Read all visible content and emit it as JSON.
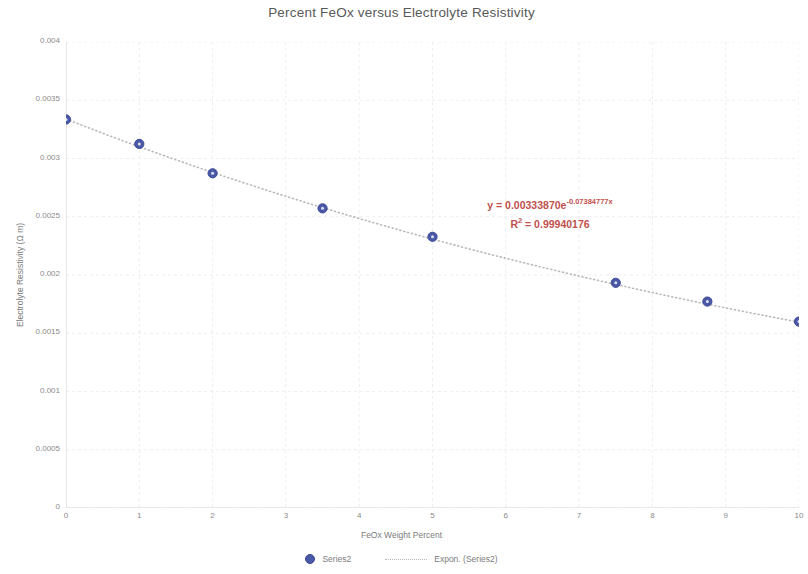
{
  "chart_data": {
    "type": "scatter",
    "title": "Percent FeOx versus Electrolyte Resistivity",
    "xlabel": "FeOx Weight Percent",
    "ylabel": "Electrolyte Resistivity (Ω m)",
    "xlim": [
      0,
      10
    ],
    "ylim": [
      0,
      0.004
    ],
    "xticks": [
      "0",
      "1",
      "2",
      "3",
      "4",
      "5",
      "6",
      "7",
      "8",
      "9",
      "10"
    ],
    "xtick_values": [
      0,
      1,
      2,
      3,
      4,
      5,
      6,
      7,
      8,
      9,
      10
    ],
    "yticks": [
      "0",
      "0.0005",
      "0.001",
      "0.0015",
      "0.002",
      "0.0025",
      "0.003",
      "0.0035",
      "0.004"
    ],
    "ytick_values": [
      0,
      0.0005,
      0.001,
      0.0015,
      0.002,
      0.0025,
      0.003,
      0.0035,
      0.004
    ],
    "grid": true,
    "legend_position": "bottom",
    "series": [
      {
        "name": "Series2",
        "type": "scatter",
        "marker_color": "#4a58a8",
        "x": [
          0,
          1,
          2,
          3.5,
          5,
          7.5,
          8.75,
          10
        ],
        "y": [
          0.003335,
          0.003125,
          0.002873,
          0.002572,
          0.002328,
          0.001933,
          0.001772,
          0.0016
        ]
      },
      {
        "name": "Expon. (Series2)",
        "type": "line",
        "style": "dotted",
        "line_color": "#b9b9b9",
        "fit": "exponential",
        "coefficient": 0.0033387,
        "exponent": -0.07384777,
        "r_squared": 0.99940176
      }
    ],
    "annotations": [
      {
        "name": "trendline-equation",
        "color": "#c0504d",
        "line1_prefix": "y = 0.00333870e",
        "line1_exponent": "-0.07384777x",
        "line2_prefix": "R",
        "line2_sup": "2",
        "line2_value": " = 0.99940176"
      }
    ]
  },
  "legend": {
    "entries": [
      {
        "label": "Series2"
      },
      {
        "label": "Expon. (Series2)"
      }
    ]
  }
}
